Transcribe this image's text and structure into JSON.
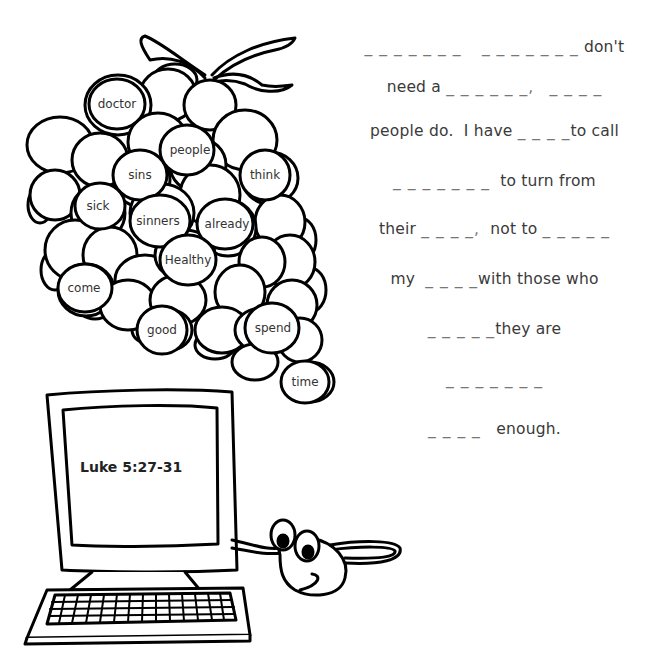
{
  "worksheet": {
    "reference": "Luke 5:27-31",
    "word_bank": [
      "doctor",
      "people",
      "sins",
      "think",
      "sick",
      "sinners",
      "already",
      "Healthy",
      "come",
      "good",
      "spend",
      "time"
    ],
    "lines": [
      {
        "blank_a": "_ _ _ _ _ _ _",
        "gap": "    ",
        "blank_b": "_ _ _ _ _ _ _",
        "text": " don't"
      },
      {
        "text_a": "need a ",
        "blank_a": "_ _ _ _ _ _,",
        "gap": "   ",
        "blank_b": "_ _ _ _"
      },
      {
        "text_a": "people do.  I have ",
        "blank_a": "_ _ _ _",
        "text_b": "to call"
      },
      {
        "blank_a": "_ _ _ _ _ _ _",
        "text_b": "  to turn from"
      },
      {
        "text_a": "their ",
        "blank_a": "_ _ _ _,",
        "text_b": "  not to ",
        "blank_b": "_ _ _ _ _"
      },
      {
        "text_a": "my  ",
        "blank_a": "_ _ _ _",
        "text_b": "with those who"
      },
      {
        "blank_a": "_ _ _ _ _",
        "text_b": "they are"
      },
      {
        "blank_a": "_ _ _ _ _ _ _"
      },
      {
        "blank_a": "_ _ _ _",
        "text_b": "   enough."
      }
    ]
  },
  "illustrations": {
    "grapes": "grape-cluster",
    "computer": "computer-monitor",
    "keyboard": "keyboard",
    "mouse": "cartoon-mouse"
  },
  "colors": {
    "ink": "#000000",
    "text": "#3a3a3a",
    "background": "#ffffff"
  }
}
